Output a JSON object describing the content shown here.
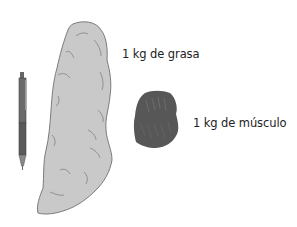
{
  "labels": {
    "fat": "1 kg de grasa",
    "muscle": "1 kg de músculo"
  },
  "objects": {
    "pen": {
      "icon": "pen-icon",
      "role": "scale reference"
    },
    "fat": {
      "icon": "fat-blob-icon",
      "color": "#c8c8c8",
      "outline": "#6e6e6e"
    },
    "muscle": {
      "icon": "muscle-blob-icon",
      "color": "#555555"
    }
  }
}
